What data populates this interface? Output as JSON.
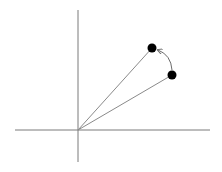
{
  "diagram": {
    "type": "vector-rotation",
    "colors": {
      "background": "#ffffff",
      "axis": "#7a7a7a",
      "vector": "#8a8a8a",
      "point": "#000000",
      "arc": "#6a6a6a"
    },
    "origin": {
      "x": 78,
      "y": 130
    },
    "axes": {
      "horizontal": {
        "x1": 15,
        "y1": 130,
        "x2": 210,
        "y2": 130
      },
      "vertical": {
        "x1": 78,
        "y1": 10,
        "x2": 78,
        "y2": 162
      }
    },
    "points": [
      {
        "id": "rotated",
        "x": 152,
        "y": 48,
        "r": 4.5
      },
      {
        "id": "initial",
        "x": 172,
        "y": 75,
        "r": 4.5
      }
    ],
    "vectors": [
      {
        "from": "origin",
        "to": "rotated"
      },
      {
        "from": "origin",
        "to": "initial"
      }
    ],
    "arc": {
      "from": "initial",
      "to": "rotated",
      "arrowhead_at": "rotated"
    }
  }
}
